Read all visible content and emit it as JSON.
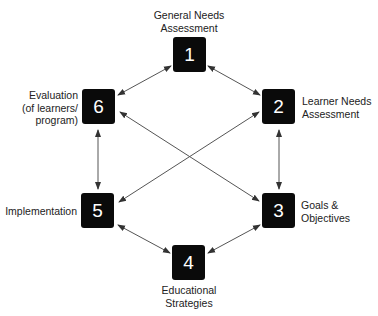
{
  "diagram": {
    "type": "cycle",
    "nodes": [
      {
        "id": "1",
        "number": "1",
        "label": "General Needs\nAssessment"
      },
      {
        "id": "2",
        "number": "2",
        "label": "Learner Needs\nAssessment"
      },
      {
        "id": "3",
        "number": "3",
        "label": "Goals &\nObjectives"
      },
      {
        "id": "4",
        "number": "4",
        "label": "Educational\nStrategies"
      },
      {
        "id": "5",
        "number": "5",
        "label": "Implementation"
      },
      {
        "id": "6",
        "number": "6",
        "label": "Evaluation\n(of learners/\nprogram)"
      }
    ],
    "edges": [
      {
        "from": "1",
        "to": "2",
        "bidirectional": true
      },
      {
        "from": "2",
        "to": "3",
        "bidirectional": true
      },
      {
        "from": "3",
        "to": "4",
        "bidirectional": true
      },
      {
        "from": "4",
        "to": "5",
        "bidirectional": true
      },
      {
        "from": "5",
        "to": "6",
        "bidirectional": true
      },
      {
        "from": "6",
        "to": "1",
        "bidirectional": true
      },
      {
        "from": "6",
        "to": "3",
        "bidirectional": true
      },
      {
        "from": "2",
        "to": "5",
        "bidirectional": true
      }
    ],
    "colors": {
      "box": "#0a0a0a",
      "box_text": "#ffffff",
      "arrow": "#555555",
      "label": "#222222"
    }
  }
}
